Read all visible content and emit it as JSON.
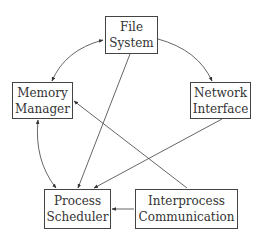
{
  "diagram": {
    "nodes": {
      "file_system": {
        "line1": "File",
        "line2": "System"
      },
      "memory_manager": {
        "line1": "Memory",
        "line2": "Manager"
      },
      "network_interface": {
        "line1": "Network",
        "line2": "Interface"
      },
      "process_scheduler": {
        "line1": "Process",
        "line2": "Scheduler"
      },
      "ipc": {
        "line1": "Interprocess",
        "line2": "Communication"
      }
    },
    "edges": [
      {
        "from": "File System",
        "to": "Memory Manager",
        "bidirectional": true
      },
      {
        "from": "File System",
        "to": "Network Interface",
        "bidirectional": false
      },
      {
        "from": "File System",
        "to": "Process Scheduler",
        "bidirectional": false
      },
      {
        "from": "Memory Manager",
        "to": "Process Scheduler",
        "bidirectional": true
      },
      {
        "from": "Network Interface",
        "to": "Process Scheduler",
        "bidirectional": false
      },
      {
        "from": "Interprocess Communication",
        "to": "Memory Manager",
        "bidirectional": false
      },
      {
        "from": "Interprocess Communication",
        "to": "Process Scheduler",
        "bidirectional": false
      }
    ],
    "colors": {
      "line": "#444444",
      "text": "#333333",
      "background": "#ffffff"
    }
  }
}
